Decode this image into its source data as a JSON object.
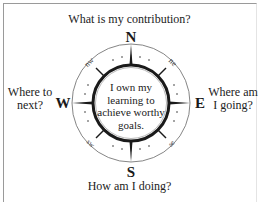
{
  "diagram": {
    "cardinals": {
      "north": "N",
      "south": "S",
      "east": "E",
      "west": "W"
    },
    "intercardinals": {
      "northwest": "nw",
      "northeast": "ne",
      "southwest": "sw",
      "southeast": "se"
    },
    "questions": {
      "north": "What is my contribution?",
      "south": "How am I doing?",
      "west": "Where to next?",
      "east": "Where am I going?"
    },
    "center_text": "I own my learning to achieve worthy goals.",
    "colors": {
      "ink": "#222222",
      "ring": "#555555",
      "border": "#9a9a9a",
      "background": "#ffffff"
    }
  }
}
